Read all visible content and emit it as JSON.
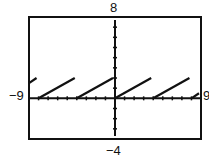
{
  "chart_data": {
    "type": "line",
    "title": "",
    "xlabel": "",
    "ylabel": "",
    "xlim": [
      -9,
      9
    ],
    "ylim": [
      -4,
      8
    ],
    "xscale": 1,
    "yscale": 1,
    "grid": false,
    "function": "y = 0.5*(x - 4*floor(x/4))",
    "segments": [
      {
        "x": [
          -9,
          -8
        ],
        "y": [
          1.5,
          2
        ]
      },
      {
        "x": [
          -8,
          -4
        ],
        "y": [
          0,
          2
        ]
      },
      {
        "x": [
          -4,
          0
        ],
        "y": [
          0,
          2
        ]
      },
      {
        "x": [
          0,
          4
        ],
        "y": [
          0,
          2
        ]
      },
      {
        "x": [
          4,
          8
        ],
        "y": [
          0,
          2
        ]
      },
      {
        "x": [
          8,
          9
        ],
        "y": [
          0,
          0.5
        ]
      }
    ],
    "window_labels": {
      "xmin": "−9",
      "xmax": "9",
      "ymin": "−4",
      "ymax": "8"
    }
  },
  "colors": {
    "line": "#111111",
    "frame": "#111111",
    "background": "#ffffff"
  }
}
